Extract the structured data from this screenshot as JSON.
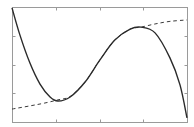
{
  "chart_data": {
    "type": "line",
    "title": "",
    "xlabel": "",
    "ylabel": "",
    "xlim": [
      0,
      4
    ],
    "ylim": [
      0,
      4
    ],
    "x_ticks": [
      1,
      2,
      3
    ],
    "y_ticks": [
      1,
      2,
      3
    ],
    "tick_labels_visible": false,
    "grid": false,
    "legend": null,
    "series": [
      {
        "name": "solid-curve",
        "style": "solid",
        "color": "#2a2a2a",
        "x": [
          0,
          0.18,
          0.41,
          0.64,
          0.87,
          1.05,
          1.33,
          1.67,
          2.01,
          2.35,
          2.7,
          2.95,
          3.27,
          3.61,
          3.84,
          4.0
        ],
        "y": [
          3.97,
          3.03,
          2.05,
          1.32,
          0.87,
          0.73,
          0.87,
          1.39,
          2.16,
          2.85,
          3.23,
          3.3,
          3.1,
          2.23,
          1.29,
          0.14
        ]
      },
      {
        "name": "dashed-curve",
        "style": "dashed",
        "color": "#3a3a3a",
        "x": [
          0,
          0.41,
          0.75,
          1.05,
          1.33,
          1.67,
          2.01,
          2.35,
          2.7,
          2.95,
          3.27,
          3.61,
          4.0
        ],
        "y": [
          0.45,
          0.56,
          0.66,
          0.77,
          0.89,
          1.39,
          2.16,
          2.85,
          3.23,
          3.3,
          3.41,
          3.5,
          3.55
        ]
      }
    ]
  },
  "layout": {
    "plot_left": 12,
    "plot_top": 7,
    "plot_right": 187,
    "plot_bottom": 122
  }
}
